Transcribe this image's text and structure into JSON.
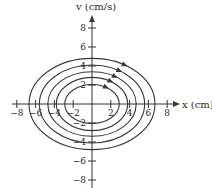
{
  "figure": {
    "type": "phase-portrait",
    "origin_px": {
      "x": 92,
      "y": 104
    },
    "scale_px_per_unit": {
      "x": 9.4,
      "y": 9.5
    },
    "x_axis": {
      "label": "x (cm)",
      "ticks": [
        -8,
        -6,
        -4,
        -2,
        2,
        4,
        6,
        8
      ],
      "tick_labels": [
        "−8",
        "−6",
        "−4",
        "−2",
        "2",
        "4",
        "6",
        "8"
      ]
    },
    "y_axis": {
      "label": "v (cm/s)",
      "ticks": [
        8,
        6,
        4,
        2,
        -2,
        -4,
        -6,
        -8
      ],
      "tick_labels": [
        "8",
        "6",
        "4",
        "2",
        "−2",
        "−4",
        "−6",
        "−8"
      ]
    },
    "orbits": [
      {
        "a": 6.7,
        "b": 4.8
      },
      {
        "a": 5.6,
        "b": 4.1
      },
      {
        "a": 4.7,
        "b": 3.4
      },
      {
        "a": 3.8,
        "b": 2.8
      },
      {
        "a": 2.9,
        "b": 2.05
      }
    ],
    "direction": "clockwise",
    "colors": {
      "line": "#3a3a3a",
      "axis": "#333333",
      "text": "#2a2a2a",
      "background": "#ffffff"
    }
  }
}
